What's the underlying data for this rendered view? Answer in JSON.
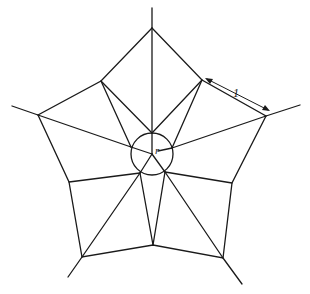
{
  "diagram": {
    "type": "pentagonal net with central circle",
    "labels": {
      "edge_length": "1",
      "radius": "r"
    },
    "colors": {
      "stroke": "#1a1a1a",
      "background": "#ffffff"
    }
  }
}
